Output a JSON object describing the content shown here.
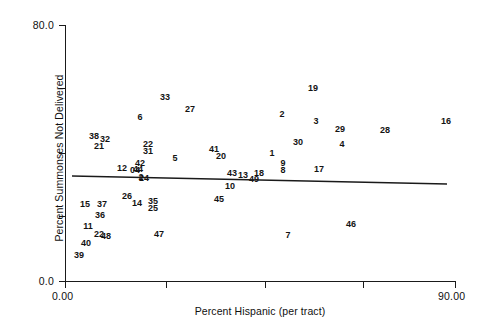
{
  "chart_data": {
    "type": "scatter",
    "title": "",
    "xlabel": "Percent Hispanic (per tract)",
    "ylabel": "Percent Summonses Not Delivered",
    "xlim": [
      0.0,
      90.0
    ],
    "ylim": [
      0.0,
      80.0
    ],
    "grid": false,
    "legend": null,
    "x_tick_labels": [
      "0.00",
      "90.00"
    ],
    "x_tick_values": [
      0.0,
      90.0
    ],
    "x_tick_positions_px": [
      65,
      166,
      265,
      363,
      455
    ],
    "y_tick_labels": [
      "80.0",
      "0.0"
    ],
    "y_tick_values": [
      80.0,
      0.0
    ],
    "y_tick_positions_px": [
      25,
      88,
      153,
      216,
      281
    ],
    "point_label_style": "case-number",
    "points": [
      {
        "label": "38",
        "x": 3.2,
        "y": 43.0,
        "px": 94,
        "py": 136
      },
      {
        "label": "32",
        "x": 5.6,
        "y": 42.2,
        "px": 105,
        "py": 139
      },
      {
        "label": "21",
        "x": 4.2,
        "y": 40.0,
        "px": 99,
        "py": 146
      },
      {
        "label": "22",
        "x": 14.6,
        "y": 40.6,
        "px": 148,
        "py": 144
      },
      {
        "label": "31",
        "x": 14.6,
        "y": 38.8,
        "px": 148,
        "py": 151
      },
      {
        "label": "6",
        "x": 12.8,
        "y": 47.5,
        "px": 140,
        "py": 117
      },
      {
        "label": "33",
        "x": 20.2,
        "y": 53.7,
        "px": 165,
        "py": 97
      },
      {
        "label": "27",
        "x": 25.6,
        "y": 51.5,
        "px": 190,
        "py": 109
      },
      {
        "label": "19",
        "x": 46.8,
        "y": 55.5,
        "px": 313,
        "py": 88
      },
      {
        "label": "2",
        "x": 41.5,
        "y": 49.0,
        "px": 282,
        "py": 114
      },
      {
        "label": "3",
        "x": 48.5,
        "y": 47.0,
        "px": 316,
        "py": 121
      },
      {
        "label": "29",
        "x": 54.0,
        "y": 44.5,
        "px": 340,
        "py": 129
      },
      {
        "label": "28",
        "x": 62.5,
        "y": 44.0,
        "px": 385,
        "py": 130
      },
      {
        "label": "16",
        "x": 78.5,
        "y": 46.5,
        "px": 446,
        "py": 121
      },
      {
        "label": "30",
        "x": 44.2,
        "y": 42.2,
        "px": 298,
        "py": 142
      },
      {
        "label": "4",
        "x": 54.2,
        "y": 41.5,
        "px": 342,
        "py": 144
      },
      {
        "label": "1",
        "x": 40.5,
        "y": 40.0,
        "px": 272,
        "py": 153
      },
      {
        "label": "9",
        "x": 43.0,
        "y": 37.6,
        "px": 283,
        "py": 163
      },
      {
        "label": "8",
        "x": 43.0,
        "y": 36.6,
        "px": 283,
        "py": 170
      },
      {
        "label": "17",
        "x": 49.5,
        "y": 37.4,
        "px": 319,
        "py": 169
      },
      {
        "label": "41",
        "x": 30.5,
        "y": 39.4,
        "px": 214,
        "py": 149
      },
      {
        "label": "20",
        "x": 31.5,
        "y": 38.2,
        "px": 221,
        "py": 156
      },
      {
        "label": "5",
        "x": 22.5,
        "y": 38.0,
        "px": 175,
        "py": 158
      },
      {
        "label": "12",
        "x": 11.2,
        "y": 35.6,
        "px": 122,
        "py": 168
      },
      {
        "label": "42",
        "x": 14.5,
        "y": 36.2,
        "px": 140,
        "py": 163
      },
      {
        "label": "44",
        "x": 14.2,
        "y": 35.0,
        "px": 138,
        "py": 169
      },
      {
        "label": "04",
        "x": 13.8,
        "y": 35.0,
        "px": 135,
        "py": 170
      },
      {
        "label": "2",
        "x": 15.0,
        "y": 33.3,
        "px": 141,
        "py": 177
      },
      {
        "label": "24",
        "x": 15.4,
        "y": 33.0,
        "px": 144,
        "py": 178
      },
      {
        "label": "43",
        "x": 33.6,
        "y": 34.2,
        "px": 232,
        "py": 173
      },
      {
        "label": "13",
        "x": 36.4,
        "y": 33.8,
        "px": 243,
        "py": 175
      },
      {
        "label": "18",
        "x": 39.4,
        "y": 34.2,
        "px": 259,
        "py": 173
      },
      {
        "label": "49",
        "x": 38.6,
        "y": 32.9,
        "px": 254,
        "py": 179
      },
      {
        "label": "10",
        "x": 34.0,
        "y": 31.2,
        "px": 230,
        "py": 186
      },
      {
        "label": "45",
        "x": 32.4,
        "y": 29.8,
        "px": 219,
        "py": 199
      },
      {
        "label": "26",
        "x": 11.6,
        "y": 29.8,
        "px": 127,
        "py": 196
      },
      {
        "label": "14",
        "x": 16.4,
        "y": 28.6,
        "px": 137,
        "py": 203
      },
      {
        "label": "35",
        "x": 20.4,
        "y": 28.8,
        "px": 153,
        "py": 201
      },
      {
        "label": "25",
        "x": 20.4,
        "y": 27.4,
        "px": 153,
        "py": 208
      },
      {
        "label": "15",
        "x": 2.0,
        "y": 28.4,
        "px": 85,
        "py": 204
      },
      {
        "label": "37",
        "x": 5.4,
        "y": 28.4,
        "px": 102,
        "py": 204
      },
      {
        "label": "36",
        "x": 5.0,
        "y": 26.4,
        "px": 100,
        "py": 215
      },
      {
        "label": "11",
        "x": 2.4,
        "y": 24.4,
        "px": 88,
        "py": 226
      },
      {
        "label": "22",
        "x": 4.8,
        "y": 22.2,
        "px": 99,
        "py": 234
      },
      {
        "label": "48",
        "x": 6.0,
        "y": 22.0,
        "px": 106,
        "py": 236
      },
      {
        "label": "40",
        "x": 1.8,
        "y": 21.0,
        "px": 86,
        "py": 243
      },
      {
        "label": "39",
        "x": 0.6,
        "y": 18.6,
        "px": 79,
        "py": 255
      },
      {
        "label": "47",
        "x": 20.4,
        "y": 23.0,
        "px": 159,
        "py": 234
      },
      {
        "label": "7",
        "x": 42.0,
        "y": 22.0,
        "px": 288,
        "py": 235
      },
      {
        "label": "46",
        "x": 61.0,
        "y": 24.6,
        "px": 351,
        "py": 224
      }
    ],
    "trend_line": {
      "type": "linear-fit",
      "x_start_px": 72,
      "y_start_px": 176,
      "x_end_px": 447,
      "y_end_px": 184,
      "color": "#1a1a1a",
      "slope_sign": "negative"
    }
  },
  "axes": {
    "y_labels": [
      {
        "text": "80.0",
        "top_px": 25
      },
      {
        "text": "",
        "top_px": 88
      },
      {
        "text": "",
        "top_px": 153
      },
      {
        "text": "",
        "top_px": 216
      },
      {
        "text": "0.0",
        "top_px": 281
      }
    ],
    "x_labels": [
      {
        "text": "0.00",
        "left_px": 65
      },
      {
        "text": "90.00",
        "left_px": 455
      }
    ],
    "y_title": "Percent Summonses Not Delivered",
    "x_title": "Percent Hispanic (per tract)"
  }
}
